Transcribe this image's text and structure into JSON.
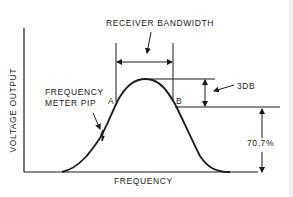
{
  "diagram": {
    "labels": {
      "receiver_bandwidth": "RECEIVER BANDWIDTH",
      "db_drop": "3DB",
      "percent": "70.7%",
      "point_a": "A",
      "point_b": "B",
      "pip_line1": "FREQUENCY",
      "pip_line2": "METER PIP",
      "x_axis": "FREQUENCY",
      "y_axis": "VOLTAGE OUTPUT"
    },
    "colors": {
      "ink": "#1a1a1a",
      "background": "#ffffff"
    }
  }
}
